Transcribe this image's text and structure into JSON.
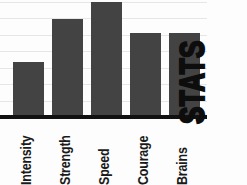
{
  "chart_data": {
    "type": "bar",
    "title": "STATS",
    "xlabel": "",
    "ylabel": "",
    "categories": [
      "Intensity",
      "Strength",
      "Speed",
      "Courage",
      "Brains"
    ],
    "values": [
      48,
      85,
      100,
      73,
      73
    ],
    "ylim": [
      0,
      100
    ],
    "grid": true,
    "gridlines": [
      0,
      14,
      29,
      43,
      57,
      71,
      86,
      100
    ],
    "legend": "none",
    "bar_color": "#434343",
    "axis_color": "#111111",
    "grid_color": "#e6e6e6",
    "background_color": "#fdfdfd",
    "title_color": "#0d0d0d",
    "label_color": "#1a1a1a",
    "title_orientation": "vertical-bottom-to-top",
    "label_orientation": "vertical-bottom-to-top"
  },
  "axis": {
    "baseline_name": "x-axis-baseline"
  }
}
